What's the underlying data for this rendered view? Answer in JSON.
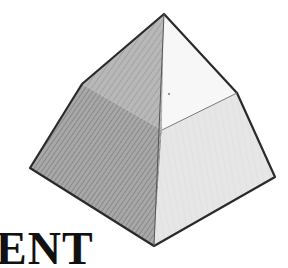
{
  "image": {
    "subject": "shaded three-dimensional solid (pyramid-like polyhedron) line drawing",
    "background_color": "#ffffff",
    "line_color": "#2a2a2a",
    "left_face_color": "#9a9a9a",
    "right_face_color": "#ededed",
    "right_lower_face_color": "#e2e2e2"
  },
  "vertices": {
    "apex": [
      164,
      14
    ],
    "left_upper": [
      82,
      84
    ],
    "left": [
      30,
      168
    ],
    "bottom": [
      154,
      246
    ],
    "right": [
      275,
      177
    ],
    "right_upper": [
      237,
      93
    ],
    "center": [
      162,
      130
    ]
  },
  "caption": {
    "text": "ENT"
  }
}
